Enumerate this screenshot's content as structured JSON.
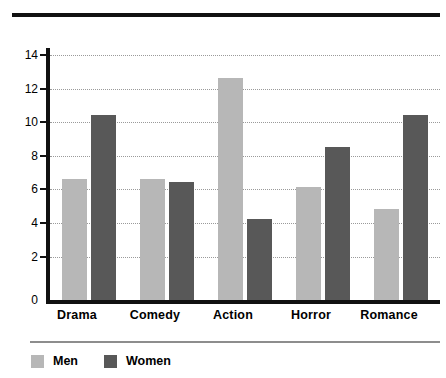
{
  "chart_data": {
    "type": "bar",
    "title": "",
    "subtitle": "",
    "xlabel": "",
    "ylabel": "",
    "categories": [
      "Drama",
      "Comedy",
      "Action",
      "Horror",
      "Romance"
    ],
    "series": [
      {
        "name": "Men",
        "color": "#b7b7b7",
        "values": [
          7.2,
          7.2,
          13.2,
          6.7,
          5.4
        ]
      },
      {
        "name": "Women",
        "color": "#585858",
        "values": [
          11.0,
          7.0,
          4.8,
          9.1,
          11.0
        ]
      }
    ],
    "ylim": [
      0,
      15
    ],
    "yticks": [
      0,
      2,
      4,
      6,
      8,
      10,
      12,
      14
    ],
    "ytick_labels": [
      "0",
      "2",
      "4",
      "6",
      "8",
      "10",
      "12",
      "14"
    ],
    "grid": "horizontal-dotted",
    "legend_position": "bottom-left",
    "legend": [
      "Men",
      "Women"
    ]
  },
  "decor": {
    "top_rule_color": "#111111",
    "axis_color": "#111111",
    "grid_color": "#9a9a9a",
    "legend_rule_color": "#8d8d8d"
  }
}
